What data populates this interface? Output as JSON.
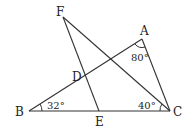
{
  "diagram": {
    "type": "geometry",
    "points": {
      "A": {
        "label": "A",
        "x": 142,
        "y": 39
      },
      "B": {
        "label": "B",
        "x": 29,
        "y": 111
      },
      "C": {
        "label": "C",
        "x": 170,
        "y": 111
      },
      "D": {
        "label": "D",
        "x": 85,
        "y": 76
      },
      "E": {
        "label": "E",
        "x": 99,
        "y": 111
      },
      "F": {
        "label": "F",
        "x": 63,
        "y": 17
      }
    },
    "segments": [
      "AB",
      "BC",
      "AC",
      "FC",
      "FE"
    ],
    "angles": {
      "A": "80°",
      "B": "32°",
      "C": "40°"
    }
  }
}
